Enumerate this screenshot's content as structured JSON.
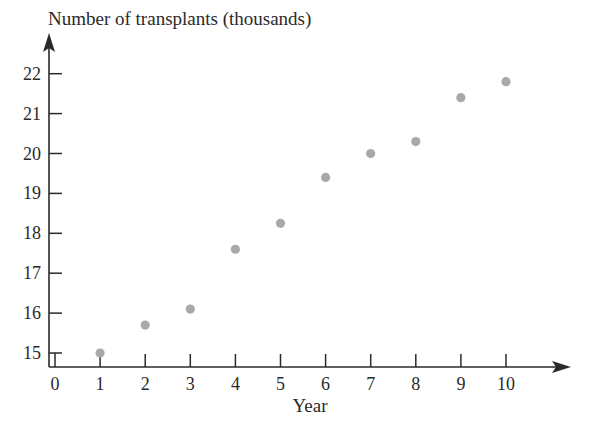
{
  "chart_data": {
    "type": "scatter",
    "title": "",
    "ylabel": "Number of transplants (thousands)",
    "xlabel": "Year",
    "x": [
      1,
      2,
      3,
      4,
      5,
      6,
      7,
      8,
      9,
      10
    ],
    "series": [
      {
        "name": "Number of transplants (thousands)",
        "values": [
          15.0,
          15.7,
          16.1,
          17.6,
          18.25,
          19.4,
          20.0,
          20.3,
          21.4,
          21.8
        ]
      }
    ],
    "x_ticks": [
      "0",
      "1",
      "2",
      "3",
      "4",
      "5",
      "6",
      "7",
      "8",
      "9",
      "10"
    ],
    "y_ticks": [
      "15",
      "16",
      "17",
      "18",
      "19",
      "20",
      "21",
      "22"
    ],
    "xlim": [
      0,
      11
    ],
    "ylim": [
      14.7,
      22.8
    ],
    "y_axis_break": true,
    "grid": false,
    "legend": "none",
    "colors": {
      "point": "#a9a9a9",
      "axis": "#2a2a2a",
      "text": "#2a2a2a"
    }
  }
}
